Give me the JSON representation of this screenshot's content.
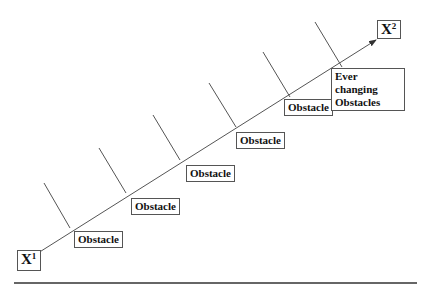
{
  "diagram": {
    "type": "progress-path-with-obstacles",
    "start_node": {
      "base": "X",
      "sup": "1"
    },
    "end_node": {
      "base": "X",
      "sup": "2"
    },
    "obstacles": [
      {
        "label": "Obstacle"
      },
      {
        "label": "Obstacle"
      },
      {
        "label": "Obstacle"
      },
      {
        "label": "Obstacle"
      },
      {
        "label": "Obstacle"
      },
      {
        "label": "Ever changing Obstacles",
        "line1": "Ever changing",
        "line2": "Obstacles"
      }
    ],
    "branch_count": 6,
    "colors": {
      "line": "#555555",
      "text": "#111111",
      "background": "#ffffff"
    }
  }
}
